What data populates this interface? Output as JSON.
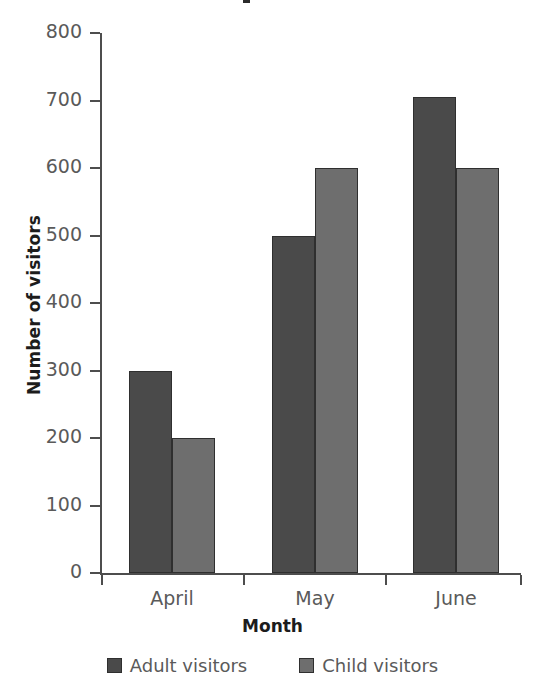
{
  "chart_data": {
    "type": "bar",
    "title": "",
    "title_cropped": true,
    "categories": [
      "April",
      "May",
      "June"
    ],
    "series": [
      {
        "name": "Adult visitors",
        "values": [
          300,
          500,
          705
        ],
        "color": "#4a4a4a"
      },
      {
        "name": "Child visitors",
        "values": [
          200,
          600,
          600
        ],
        "color": "#6e6e6e"
      }
    ],
    "xlabel": "Month",
    "ylabel": "Number of visitors",
    "ylim": [
      0,
      800
    ],
    "ytick_labels": [
      "800",
      "700",
      "600",
      "500",
      "400",
      "300",
      "200",
      "100",
      "0"
    ],
    "ytick_values": [
      800,
      700,
      600,
      500,
      400,
      300,
      200,
      100,
      0
    ],
    "grid": false,
    "legend_position": "bottom"
  },
  "axis": {
    "y_label": "Number of visitors",
    "x_label": "Month"
  },
  "legend": {
    "items": [
      {
        "label": "Adult visitors",
        "color": "#4a4a4a"
      },
      {
        "label": "Child visitors",
        "color": "#6e6e6e"
      }
    ]
  }
}
